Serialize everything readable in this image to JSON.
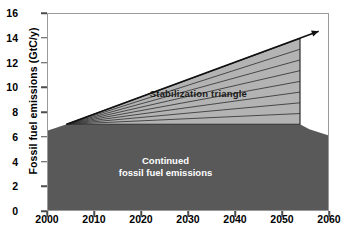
{
  "chart_data": {
    "type": "area",
    "title": "",
    "xlabel": "",
    "ylabel": "Fossil fuel emissions (GtC/y)",
    "xlim": [
      2000,
      2060
    ],
    "ylim": [
      0,
      16
    ],
    "xticks": [
      2000,
      2010,
      2020,
      2030,
      2040,
      2050,
      2060
    ],
    "xticklabels": [
      "2000",
      "2010",
      "2020",
      "2030",
      "2040",
      "2050",
      "2060"
    ],
    "yticks": [
      0,
      2,
      4,
      6,
      8,
      10,
      12,
      14,
      16
    ],
    "yticklabels": [
      "0",
      "2",
      "4",
      "6",
      "8",
      "10",
      "12",
      "14",
      "16"
    ],
    "grid": false,
    "legend": "none",
    "series": [
      {
        "name": "Continued fossil fuel emissions",
        "fill_color": "#595959",
        "x": [
          2000,
          2004,
          2054,
          2056,
          2060
        ],
        "y": [
          6.5,
          7.0,
          7.0,
          6.6,
          6.1
        ],
        "baseline": 0
      },
      {
        "name": "Stabilization triangle",
        "fill_color": "#b3b3b3",
        "x": [
          2004,
          2054,
          2054
        ],
        "y": [
          7.0,
          14.0,
          7.0
        ],
        "wedge_count": 8
      }
    ],
    "annotations": [
      {
        "name": "stabilization-triangle-label",
        "text": "Stabilization triangle",
        "x": 2032,
        "y": 9.6
      },
      {
        "name": "continued-emissions-label-line1",
        "text": "Continued",
        "x": 2025,
        "y": 3.6
      },
      {
        "name": "continued-emissions-label-line2",
        "text": "fossil fuel emissions",
        "x": 2025,
        "y": 2.7
      },
      {
        "name": "trend-arrow",
        "text": "",
        "from_x": 2004,
        "from_y": 7.0,
        "to_x": 2058,
        "to_y": 14.6
      }
    ]
  },
  "axes": {
    "y_title": "Fossil fuel emissions (GtC/y)",
    "y_labels": [
      "16",
      "14",
      "12",
      "10",
      "8",
      "6",
      "4",
      "2",
      "0"
    ],
    "x_labels": [
      "2000",
      "2010",
      "2020",
      "2030",
      "2040",
      "2050",
      "2060"
    ]
  },
  "labels": {
    "stabilization_triangle": "Stabilization triangle",
    "continued_line1": "Continued",
    "continued_line2": "fossil fuel emissions"
  },
  "colors": {
    "continued_fill": "#595959",
    "triangle_fill": "#b3b3b3",
    "wedge_line": "#2b2b2b",
    "frame": "#9a9a9a",
    "text": "#000000",
    "inverse_text": "#ffffff"
  }
}
